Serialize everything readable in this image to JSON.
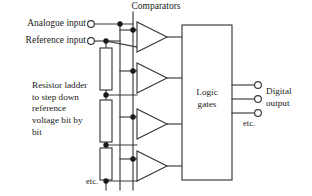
{
  "figure": {
    "kind": "flash-adc-block-diagram",
    "width": 312,
    "height": 196,
    "background": "#ffffff",
    "line_color": "#3a3a3a",
    "text_color": "#1a1a1a"
  },
  "labels": {
    "analogue_input": "Analogue input",
    "reference_input": "Reference input",
    "comparators": "Comparators",
    "resistor_ladder": "Resistor ladder to step down reference voltage bit by bit",
    "logic_gates": "Logic gates",
    "digital_output": "Digital output",
    "etc_ladder": "etc.",
    "etc_output": "etc."
  },
  "logic_gates_lines": [
    "Logic",
    "gates"
  ],
  "digital_output_lines": [
    "Digital",
    "output"
  ],
  "input_terminals": [
    {
      "name": "analogue-input-terminal",
      "cx": 91,
      "cy": 24,
      "r": 3.4
    },
    {
      "name": "reference-input-terminal",
      "cx": 91,
      "cy": 41,
      "r": 3.4
    }
  ],
  "output_terminals": [
    {
      "name": "digital-output-terminal-1",
      "cx": 258,
      "cy": 85,
      "r": 3.4
    },
    {
      "name": "digital-output-terminal-2",
      "cx": 258,
      "cy": 99,
      "r": 3.4
    },
    {
      "name": "digital-output-terminal-3",
      "cx": 258,
      "cy": 113,
      "r": 3.4
    }
  ],
  "comparators": [
    {
      "name": "comparator-1",
      "x": 137,
      "cy": 37,
      "w": 30,
      "h": 30
    },
    {
      "name": "comparator-2",
      "x": 137,
      "cy": 78,
      "w": 30,
      "h": 30
    },
    {
      "name": "comparator-3",
      "x": 137,
      "cy": 124,
      "w": 30,
      "h": 30
    },
    {
      "name": "comparator-4",
      "x": 137,
      "cy": 166,
      "w": 30,
      "h": 30
    }
  ],
  "resistors": [
    {
      "name": "resistor-1",
      "x": 100,
      "y": 48,
      "w": 12,
      "h": 42
    },
    {
      "name": "resistor-2",
      "x": 100,
      "y": 100,
      "w": 12,
      "h": 42
    },
    {
      "name": "resistor-3",
      "x": 100,
      "y": 148,
      "w": 12,
      "h": 32
    }
  ],
  "bus_lines": [
    {
      "name": "analogue-bus",
      "x": 120,
      "y1": 24,
      "y2": 190
    },
    {
      "name": "reference-tap-bus",
      "x": 133,
      "y1": 12,
      "y2": 190
    }
  ],
  "logic_box": {
    "name": "logic-gates-box",
    "x": 182,
    "y": 25,
    "w": 50,
    "h": 155
  },
  "junction_dots": [
    {
      "cx": 120,
      "cy": 24
    },
    {
      "cx": 106,
      "cy": 41
    },
    {
      "cx": 120,
      "cy": 30
    },
    {
      "cx": 120,
      "cy": 71
    },
    {
      "cx": 120,
      "cy": 117
    },
    {
      "cx": 120,
      "cy": 159
    },
    {
      "cx": 106,
      "cy": 95
    },
    {
      "cx": 106,
      "cy": 145
    },
    {
      "cx": 106,
      "cy": 181
    }
  ]
}
